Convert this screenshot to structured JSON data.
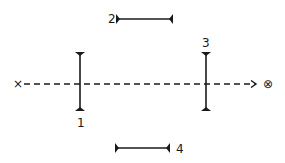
{
  "diagram": {
    "colors": {
      "stroke": "#1a1a1a",
      "background": "#ffffff"
    },
    "source": {
      "symbol": "×",
      "x": 18,
      "y": 84
    },
    "target": {
      "symbol": "⊗",
      "x": 268,
      "y": 84
    },
    "ray": {
      "x1": 24,
      "y1": 84,
      "x2": 256,
      "y2": 84,
      "style": "dashed",
      "arrow": "end"
    },
    "elements": [
      {
        "id": "1",
        "label": "1",
        "orientation": "vertical",
        "x": 80,
        "y1": 52,
        "y2": 111,
        "label_x": 77,
        "label_y": 127
      },
      {
        "id": "2",
        "label": "2",
        "orientation": "horizontal",
        "y": 19,
        "x1": 116,
        "x2": 173,
        "label_x": 108,
        "label_y": 23
      },
      {
        "id": "3",
        "label": "3",
        "orientation": "vertical",
        "x": 206,
        "y1": 52,
        "y2": 111,
        "label_x": 202,
        "label_y": 47
      },
      {
        "id": "4",
        "label": "4",
        "orientation": "horizontal",
        "y": 148,
        "x1": 115,
        "x2": 170,
        "label_x": 176,
        "label_y": 153
      }
    ]
  }
}
